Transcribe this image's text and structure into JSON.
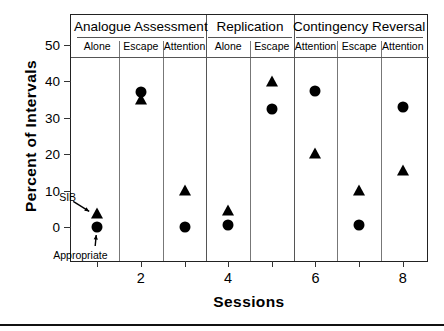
{
  "chart_data": {
    "type": "scatter",
    "title": "",
    "xlabel": "Sessions",
    "ylabel": "Percent of Intervals",
    "xlim": [
      0.4,
      8.6
    ],
    "ylim": [
      0,
      50
    ],
    "yticks": [
      0,
      10,
      20,
      30,
      40,
      50
    ],
    "xticks": [
      1,
      2,
      3,
      4,
      5,
      6,
      7,
      8
    ],
    "xtick_labels_shown": [
      "2",
      "4",
      "6",
      "8"
    ],
    "grid": false,
    "legend": "in-plot annotations",
    "x": [
      1,
      2,
      3,
      4,
      5,
      6,
      7,
      8
    ],
    "series": [
      {
        "name": "SIB",
        "marker": "triangle",
        "color": "#000000",
        "values": [
          4,
          35.5,
          10.5,
          5,
          40.5,
          20.5,
          10.5,
          16
        ]
      },
      {
        "name": "Appropriate",
        "marker": "circle",
        "color": "#000000",
        "values": [
          0,
          37,
          0,
          0.5,
          32.5,
          37.5,
          0.5,
          33
        ]
      }
    ],
    "annotations": [
      {
        "text": "SIB",
        "points_to_session": 1,
        "points_to_series": "SIB"
      },
      {
        "text": "Appropriate",
        "points_to_session": 1,
        "points_to_series": "Appropriate"
      }
    ],
    "phase_headers": [
      {
        "label": "Analogue  Assessment",
        "sessions": [
          1,
          2,
          3
        ]
      },
      {
        "label": "Replication",
        "sessions": [
          4,
          5
        ]
      },
      {
        "label": "Contingency  Reversal",
        "sessions": [
          6,
          7,
          8
        ]
      }
    ],
    "condition_headers": [
      {
        "label": "Alone",
        "session": 1
      },
      {
        "label": "Escape",
        "session": 2
      },
      {
        "label": "Attention",
        "session": 3
      },
      {
        "label": "Alone",
        "session": 4
      },
      {
        "label": "Escape",
        "session": 5
      },
      {
        "label": "Attention",
        "session": 6
      },
      {
        "label": "Escape",
        "session": 7
      },
      {
        "label": "Attention",
        "session": 8
      }
    ]
  }
}
